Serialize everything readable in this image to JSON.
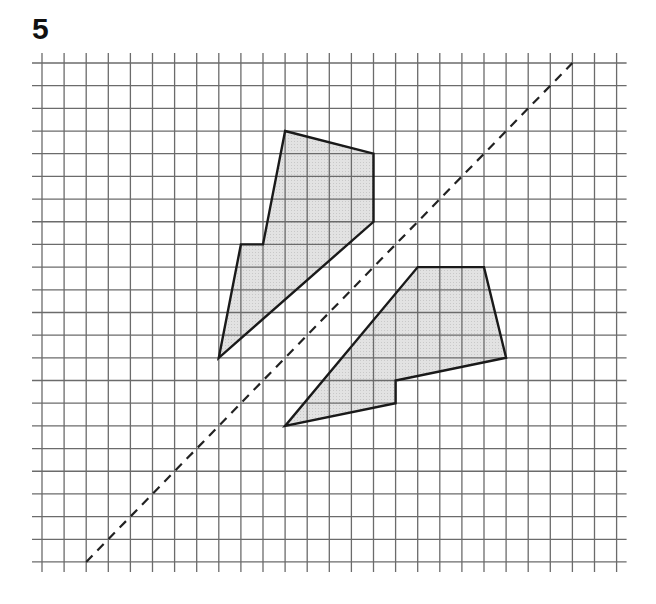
{
  "question": {
    "number": "5"
  },
  "grid": {
    "origin_x": 42,
    "origin_y": 63,
    "cell_w": 22.1,
    "cell_h": 22.68,
    "cols": 26,
    "rows": 22,
    "overhang": 10,
    "line_color": "#6b6b6b"
  },
  "mirror_line": {
    "style": "dashed",
    "from": [
      2,
      22
    ],
    "to": [
      24,
      0
    ],
    "color": "#222222"
  },
  "shapes": [
    {
      "name": "original-shape",
      "fill": "#dcdcdc",
      "stroke": "#1a1a1a",
      "vertices": [
        [
          11,
          3
        ],
        [
          15,
          4
        ],
        [
          15,
          7
        ],
        [
          8,
          13
        ],
        [
          9,
          8
        ],
        [
          10,
          8
        ]
      ]
    },
    {
      "name": "reflected-shape",
      "fill": "#dcdcdc",
      "stroke": "#1a1a1a",
      "vertices": [
        [
          17,
          9
        ],
        [
          20,
          9
        ],
        [
          21,
          13
        ],
        [
          16,
          14
        ],
        [
          16,
          15
        ],
        [
          11,
          16
        ]
      ]
    }
  ]
}
